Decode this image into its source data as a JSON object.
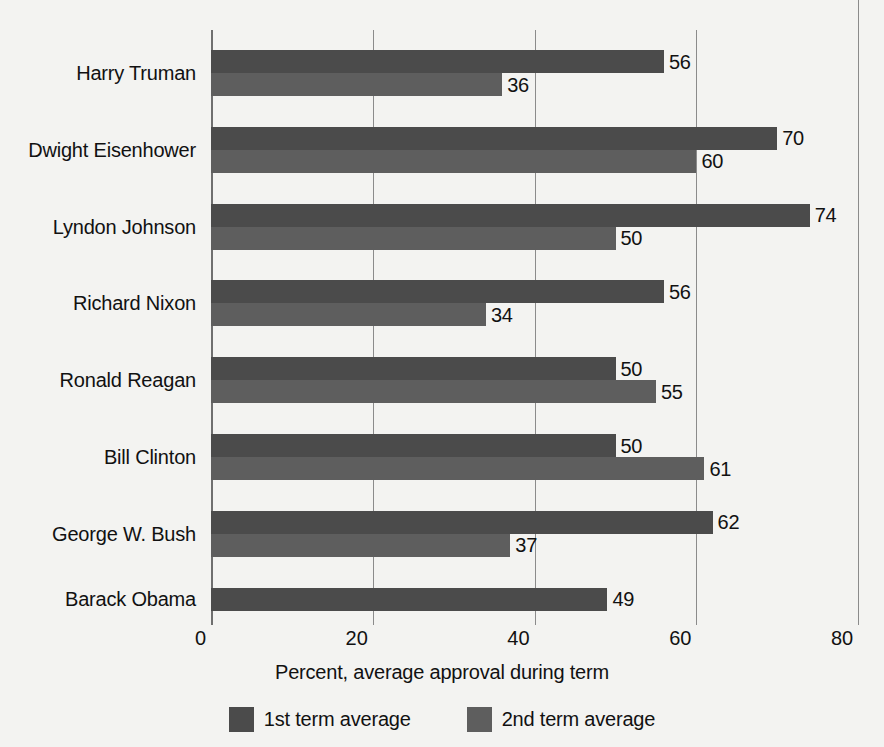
{
  "chart_data": {
    "type": "bar",
    "orientation": "horizontal",
    "title": "",
    "xlabel": "Percent, average approval during term",
    "ylabel": "",
    "xlim": [
      0,
      80
    ],
    "xticks": [
      0,
      20,
      40,
      60,
      80
    ],
    "xtick_labels": [
      "0",
      "20",
      "40",
      "60",
      "80"
    ],
    "grid": true,
    "grid_axis": "x",
    "legend_position": "bottom",
    "categories": [
      "Harry Truman",
      "Dwight Eisenhower",
      "Lyndon Johnson",
      "Richard Nixon",
      "Ronald Reagan",
      "Bill Clinton",
      "George W. Bush",
      "Barack Obama"
    ],
    "series": [
      {
        "name": "1st term average",
        "color": "#4b4b4b",
        "values": [
          56,
          70,
          74,
          56,
          50,
          50,
          62,
          49
        ]
      },
      {
        "name": "2nd term average",
        "color": "#5e5e5e",
        "values": [
          36,
          60,
          50,
          34,
          55,
          61,
          37,
          null
        ]
      }
    ]
  },
  "colors": {
    "background": "#f3f3f1",
    "term1": "#4b4b4b",
    "term2": "#5e5e5e",
    "gridline": "#8b8b8b",
    "text": "#111111"
  }
}
